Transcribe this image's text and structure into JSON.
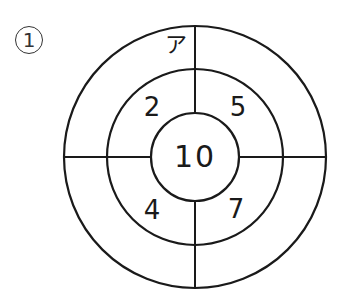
{
  "question": {
    "number": "1"
  },
  "target": {
    "center": [
      195,
      157
    ],
    "radii": {
      "outer": 131,
      "middle": 88,
      "inner": 44
    },
    "line_color": "#1a1a1a",
    "labels": {
      "top_outer_left": "ア",
      "middle_top_left": "2",
      "middle_top_right": "5",
      "middle_bottom_left": "4",
      "middle_bottom_right": "7",
      "center": "10"
    }
  }
}
